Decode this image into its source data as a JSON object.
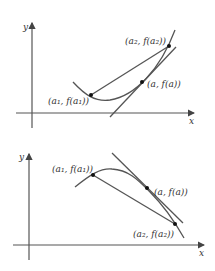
{
  "diagrams": [
    {
      "name": "convex-function",
      "axis_x_label": "x",
      "axis_y_label": "y",
      "points": [
        {
          "label": "(a₁, f(a₁))"
        },
        {
          "label": "(a, f(a))"
        },
        {
          "label": "(a₂, f(a₂))"
        }
      ]
    },
    {
      "name": "concave-function",
      "axis_x_label": "x",
      "axis_y_label": "y",
      "points": [
        {
          "label": "(a₁, f(a₁))"
        },
        {
          "label": "(a, f(a))"
        },
        {
          "label": "(a₂, f(a₂))"
        }
      ]
    }
  ],
  "colors": {
    "stroke": "#555555",
    "text": "#333333"
  }
}
